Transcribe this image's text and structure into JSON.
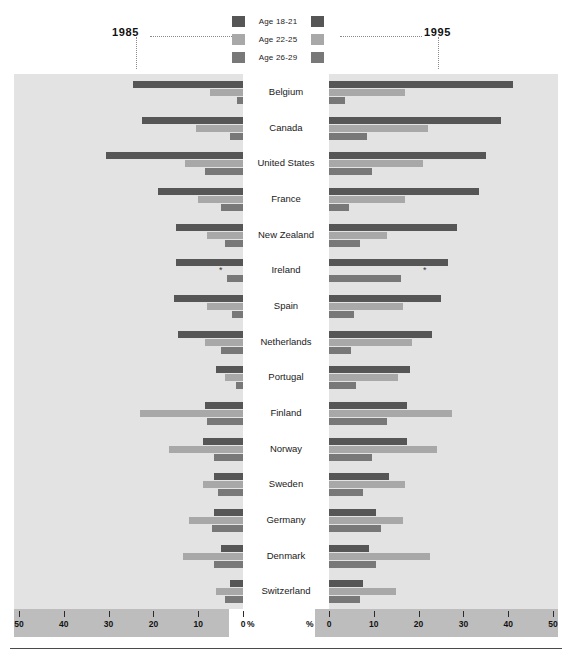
{
  "legend": {
    "items": [
      {
        "label": "Age 18-21",
        "color": "#565656"
      },
      {
        "label": "Age 22-25",
        "color": "#a8a8a8"
      },
      {
        "label": "Age 26-29",
        "color": "#787878"
      }
    ]
  },
  "panels": {
    "left_year": "1985",
    "right_year": "1995",
    "left_pct": "%",
    "right_pct": "%"
  },
  "axis": {
    "left_ticks": [
      "50",
      "40",
      "30",
      "20",
      "10",
      "0"
    ],
    "right_ticks": [
      "0",
      "10",
      "20",
      "30",
      "40",
      "50"
    ],
    "max": 50,
    "unit": "%"
  },
  "footnote_marker": "*",
  "chart_data": {
    "type": "bar",
    "title": "",
    "subtitle": "",
    "xlabel": "%",
    "ylabel": "",
    "xlim": [
      0,
      50
    ],
    "grid": false,
    "legend_position": "top-center",
    "orientation": "horizontal-bidirectional",
    "panels": [
      "1985",
      "1995"
    ],
    "series": [
      {
        "name": "Age 18-21",
        "color": "#565656"
      },
      {
        "name": "Age 22-25",
        "color": "#a8a8a8"
      },
      {
        "name": "Age 26-29",
        "color": "#787878"
      }
    ],
    "categories": [
      "Belgium",
      "Canada",
      "United States",
      "France",
      "New Zealand",
      "Ireland",
      "Spain",
      "Netherlands",
      "Portugal",
      "Finland",
      "Norway",
      "Sweden",
      "Germany",
      "Denmark",
      "Switzerland"
    ],
    "rows": [
      {
        "country": "Belgium",
        "y1985": {
          "a18_21": 24.5,
          "a22_25": 7.4,
          "a26_29": 1.3
        },
        "y1995": {
          "a18_21": 41.0,
          "a22_25": 17.0,
          "a26_29": 3.5
        }
      },
      {
        "country": "Canada",
        "y1985": {
          "a18_21": 22.5,
          "a22_25": 10.5,
          "a26_29": 3.0
        },
        "y1995": {
          "a18_21": 38.5,
          "a22_25": 22.0,
          "a26_29": 8.5
        }
      },
      {
        "country": "United States",
        "y1985": {
          "a18_21": 30.5,
          "a22_25": 13.0,
          "a26_29": 8.5
        },
        "y1995": {
          "a18_21": 35.0,
          "a22_25": 21.0,
          "a26_29": 9.5
        }
      },
      {
        "country": "France",
        "y1985": {
          "a18_21": 19.0,
          "a22_25": 10.0,
          "a26_29": 5.0
        },
        "y1995": {
          "a18_21": 33.5,
          "a22_25": 17.0,
          "a26_29": 4.5
        }
      },
      {
        "country": "New Zealand",
        "y1985": {
          "a18_21": 15.0,
          "a22_25": 8.0,
          "a26_29": 4.0
        },
        "y1995": {
          "a18_21": 28.5,
          "a22_25": 13.0,
          "a26_29": 7.0
        }
      },
      {
        "country": "Ireland",
        "y1985": {
          "a18_21": 15.0,
          "a22_25": null,
          "a26_29": 3.5
        },
        "y1995": {
          "a18_21": 26.5,
          "a22_25": null,
          "a26_29": 16.0
        }
      },
      {
        "country": "Spain",
        "y1985": {
          "a18_21": 15.5,
          "a22_25": 8.0,
          "a26_29": 2.5
        },
        "y1995": {
          "a18_21": 25.0,
          "a22_25": 16.5,
          "a26_29": 5.5
        }
      },
      {
        "country": "Netherlands",
        "y1985": {
          "a18_21": 14.5,
          "a22_25": 8.5,
          "a26_29": 5.0
        },
        "y1995": {
          "a18_21": 23.0,
          "a22_25": 18.5,
          "a26_29": 5.0
        }
      },
      {
        "country": "Portugal",
        "y1985": {
          "a18_21": 6.0,
          "a22_25": 4.0,
          "a26_29": 1.5
        },
        "y1995": {
          "a18_21": 18.0,
          "a22_25": 15.5,
          "a26_29": 6.0
        }
      },
      {
        "country": "Finland",
        "y1985": {
          "a18_21": 8.5,
          "a22_25": 23.0,
          "a26_29": 8.0
        },
        "y1995": {
          "a18_21": 17.5,
          "a22_25": 27.5,
          "a26_29": 13.0
        }
      },
      {
        "country": "Norway",
        "y1985": {
          "a18_21": 9.0,
          "a22_25": 16.5,
          "a26_29": 6.5
        },
        "y1995": {
          "a18_21": 17.5,
          "a22_25": 24.0,
          "a26_29": 9.5
        }
      },
      {
        "country": "Sweden",
        "y1985": {
          "a18_21": 6.5,
          "a22_25": 9.0,
          "a26_29": 5.5
        },
        "y1995": {
          "a18_21": 13.5,
          "a22_25": 17.0,
          "a26_29": 7.5
        }
      },
      {
        "country": "Germany",
        "y1985": {
          "a18_21": 6.5,
          "a22_25": 12.0,
          "a26_29": 7.0
        },
        "y1995": {
          "a18_21": 10.5,
          "a22_25": 16.5,
          "a26_29": 11.5
        }
      },
      {
        "country": "Denmark",
        "y1985": {
          "a18_21": 5.0,
          "a22_25": 13.5,
          "a26_29": 6.5
        },
        "y1995": {
          "a18_21": 9.0,
          "a22_25": 22.5,
          "a26_29": 10.5
        }
      },
      {
        "country": "Switzerland",
        "y1985": {
          "a18_21": 3.0,
          "a22_25": 6.0,
          "a26_29": 4.0
        },
        "y1995": {
          "a18_21": 7.5,
          "a22_25": 15.0,
          "a26_29": 7.0
        }
      }
    ]
  }
}
